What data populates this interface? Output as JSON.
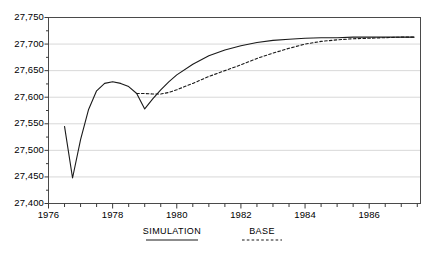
{
  "chart_data": {
    "type": "line",
    "title": "",
    "xlabel": "",
    "ylabel": "",
    "xlim": [
      1976,
      1987.6
    ],
    "ylim": [
      27400,
      27750
    ],
    "grid": true,
    "ytick_labels": [
      "27,400",
      "27,450",
      "27,500",
      "27,550",
      "27,600",
      "27,650",
      "27,700",
      "27,750"
    ],
    "ytick_values": [
      27400,
      27450,
      27500,
      27550,
      27600,
      27650,
      27700,
      27750
    ],
    "xtick_labels": [
      "1976",
      "1978",
      "1980",
      "1982",
      "1984",
      "1986"
    ],
    "xtick_values": [
      1976,
      1978,
      1980,
      1982,
      1984,
      1986
    ],
    "minor_xtick_step": 0.5,
    "legend_position": "below-axes",
    "series": [
      {
        "name": "SIMULATION",
        "style": "solid",
        "color": "#1a1a1a",
        "x": [
          1976.5,
          1976.75,
          1977.0,
          1977.25,
          1977.5,
          1977.75,
          1978.0,
          1978.25,
          1978.5,
          1978.75,
          1979.0,
          1979.25,
          1979.5,
          1979.75,
          1980.0,
          1980.5,
          1981.0,
          1981.5,
          1982.0,
          1982.5,
          1983.0,
          1983.5,
          1984.0,
          1984.5,
          1985.0,
          1985.5,
          1986.0,
          1986.5,
          1987.0,
          1987.4
        ],
        "y": [
          27545,
          27448,
          27520,
          27577,
          27612,
          27626,
          27629,
          27626,
          27620,
          27607,
          27578,
          27597,
          27614,
          27629,
          27642,
          27662,
          27678,
          27689,
          27697,
          27703,
          27707,
          27709,
          27711,
          27712,
          27712,
          27713,
          27713,
          27713,
          27713,
          27713
        ]
      },
      {
        "name": "BASE",
        "style": "dashed",
        "color": "#1a1a1a",
        "x": [
          1978.75,
          1979.0,
          1979.25,
          1979.5,
          1979.75,
          1980.0,
          1980.5,
          1981.0,
          1981.5,
          1982.0,
          1982.5,
          1983.0,
          1983.5,
          1984.0,
          1984.5,
          1985.0,
          1985.5,
          1986.0,
          1986.5,
          1987.0,
          1987.4
        ],
        "y": [
          27607,
          27607,
          27606,
          27606,
          27609,
          27614,
          27626,
          27639,
          27650,
          27661,
          27673,
          27683,
          27692,
          27700,
          27705,
          27708,
          27710,
          27711,
          27712,
          27713,
          27713
        ]
      }
    ]
  },
  "legend": {
    "items": [
      {
        "label": "SIMULATION",
        "style": "solid"
      },
      {
        "label": "BASE",
        "style": "dashed"
      }
    ]
  }
}
